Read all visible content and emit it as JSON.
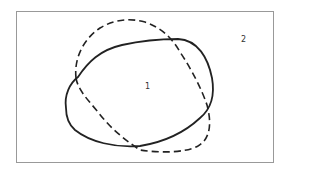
{
  "diagram": {
    "type": "overlapping-regions",
    "frame": {
      "x": 16,
      "y": 11,
      "width": 257,
      "height": 151,
      "stroke": "#888888"
    },
    "regions": [
      {
        "id": "solid-curve",
        "style": "solid",
        "stroke": "#222222"
      },
      {
        "id": "dashed-curve",
        "style": "dashed",
        "stroke": "#222222"
      }
    ],
    "labels": [
      {
        "id": "label-1",
        "text": "1",
        "x": 145,
        "y": 82
      },
      {
        "id": "label-2",
        "text": "2",
        "x": 241,
        "y": 35
      }
    ]
  }
}
